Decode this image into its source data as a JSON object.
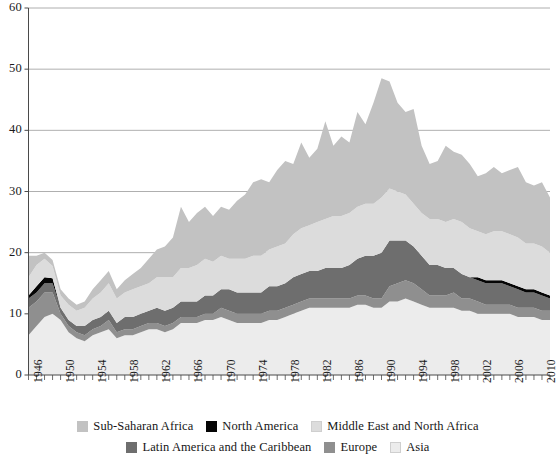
{
  "chart_data": {
    "type": "area",
    "stacked": true,
    "title": "",
    "subtitle": "",
    "xlabel": "",
    "ylabel": "",
    "xlim": [
      1946,
      2011
    ],
    "ylim": [
      0,
      60
    ],
    "yticks": [
      0,
      10,
      20,
      30,
      40,
      50,
      60
    ],
    "ytick_labels": [
      "0",
      "10",
      "20",
      "30",
      "40",
      "50",
      "60"
    ],
    "gridlines": true,
    "grid_axis": "y",
    "minor_xticks_every": 1,
    "legend_position": "bottom",
    "x": [
      1946,
      1947,
      1948,
      1949,
      1950,
      1951,
      1952,
      1953,
      1954,
      1955,
      1956,
      1957,
      1958,
      1959,
      1960,
      1961,
      1962,
      1963,
      1964,
      1965,
      1966,
      1967,
      1968,
      1969,
      1970,
      1971,
      1972,
      1973,
      1974,
      1975,
      1976,
      1977,
      1978,
      1979,
      1980,
      1981,
      1982,
      1983,
      1984,
      1985,
      1986,
      1987,
      1988,
      1989,
      1990,
      1991,
      1992,
      1993,
      1994,
      1995,
      1996,
      1997,
      1998,
      1999,
      2000,
      2001,
      2002,
      2003,
      2004,
      2005,
      2006,
      2007,
      2008,
      2009,
      2010,
      2011
    ],
    "xtick_labels": [
      "1946",
      "1950",
      "1954",
      "1958",
      "1962",
      "1966",
      "1970",
      "1974",
      "1978",
      "1982",
      "1986",
      "1990",
      "1994",
      "1998",
      "2002",
      "2006",
      "2010"
    ],
    "xtick_values": [
      1946,
      1950,
      1954,
      1958,
      1962,
      1966,
      1970,
      1974,
      1978,
      1982,
      1986,
      1990,
      1994,
      1998,
      2002,
      2006,
      2010
    ],
    "stack_order_bottom_to_top": [
      "Asia",
      "Europe",
      "Latin America and the Caribbean",
      "North America",
      "Middle East and North Africa",
      "Sub-Saharan Africa"
    ],
    "series": [
      {
        "name": "Asia",
        "color": "#ececec",
        "values": [
          6.5,
          8.0,
          9.5,
          10.0,
          9.0,
          7.0,
          6.0,
          5.5,
          6.5,
          7.0,
          7.5,
          6.0,
          6.5,
          6.5,
          7.0,
          7.5,
          7.5,
          7.0,
          7.5,
          8.5,
          8.5,
          8.5,
          9.0,
          9.0,
          9.5,
          9.0,
          8.5,
          8.5,
          8.5,
          8.5,
          9.0,
          9.0,
          9.5,
          10.0,
          10.5,
          11.0,
          11.0,
          11.0,
          11.0,
          11.0,
          11.0,
          11.5,
          11.5,
          11.0,
          11.0,
          12.0,
          12.0,
          12.5,
          12.0,
          11.5,
          11.0,
          11.0,
          11.0,
          11.0,
          10.5,
          10.5,
          10.0,
          10.0,
          10.0,
          10.0,
          10.0,
          9.5,
          9.5,
          9.5,
          9.0,
          9.0
        ]
      },
      {
        "name": "Europe",
        "color": "#8f8f8f",
        "values": [
          4.5,
          4.0,
          4.0,
          3.5,
          1.0,
          1.0,
          1.0,
          1.0,
          1.0,
          1.0,
          1.5,
          1.0,
          1.0,
          1.0,
          1.0,
          1.0,
          1.0,
          1.0,
          1.0,
          1.0,
          1.0,
          1.0,
          1.0,
          1.0,
          1.5,
          1.5,
          1.5,
          1.5,
          1.5,
          1.5,
          1.5,
          1.5,
          1.5,
          1.5,
          1.5,
          1.5,
          1.5,
          1.5,
          1.5,
          1.5,
          1.5,
          1.5,
          1.5,
          1.5,
          1.5,
          2.5,
          3.0,
          3.0,
          3.0,
          2.5,
          2.0,
          2.0,
          2.0,
          2.5,
          2.0,
          2.0,
          2.0,
          1.5,
          1.5,
          1.5,
          1.5,
          1.5,
          1.5,
          1.5,
          1.5,
          1.5
        ]
      },
      {
        "name": "Latin America and the Caribbean",
        "color": "#6e6e6e",
        "values": [
          1.5,
          1.5,
          1.5,
          1.5,
          1.0,
          1.0,
          1.0,
          1.5,
          1.5,
          1.5,
          1.5,
          1.5,
          2.0,
          2.0,
          2.0,
          2.0,
          2.5,
          2.5,
          2.5,
          2.5,
          2.5,
          2.5,
          3.0,
          3.0,
          3.0,
          3.5,
          3.5,
          3.5,
          3.5,
          3.5,
          4.0,
          4.0,
          4.0,
          4.5,
          4.5,
          4.5,
          4.5,
          5.0,
          5.0,
          5.0,
          5.5,
          6.0,
          6.5,
          7.0,
          7.5,
          7.5,
          7.0,
          6.5,
          6.0,
          5.5,
          5.0,
          5.0,
          4.5,
          4.0,
          4.0,
          3.5,
          3.5,
          3.5,
          3.5,
          3.5,
          3.0,
          3.0,
          2.5,
          2.5,
          2.5,
          2.0
        ]
      },
      {
        "name": "North America",
        "color": "#050505",
        "values": [
          0.5,
          1.0,
          1.0,
          0.8,
          0.0,
          0.0,
          0.0,
          0.0,
          0.0,
          0.0,
          0.0,
          0.0,
          0.0,
          0.0,
          0.0,
          0.0,
          0.0,
          0.0,
          0.0,
          0.0,
          0.0,
          0.0,
          0.0,
          0.0,
          0.0,
          0.0,
          0.0,
          0.0,
          0.0,
          0.0,
          0.0,
          0.0,
          0.0,
          0.0,
          0.0,
          0.0,
          0.0,
          0.0,
          0.0,
          0.0,
          0.0,
          0.0,
          0.0,
          0.0,
          0.0,
          0.0,
          0.0,
          0.0,
          0.0,
          0.0,
          0.0,
          0.0,
          0.0,
          0.0,
          0.0,
          0.0,
          0.5,
          0.5,
          0.5,
          0.5,
          0.5,
          0.5,
          0.5,
          0.5,
          0.5,
          0.5
        ]
      },
      {
        "name": "Middle East and North Africa",
        "color": "#dcdcdc",
        "values": [
          3.0,
          3.5,
          3.0,
          2.0,
          2.0,
          2.5,
          2.5,
          3.0,
          3.5,
          4.0,
          4.5,
          4.0,
          4.0,
          4.5,
          4.5,
          4.5,
          5.0,
          5.5,
          5.0,
          5.5,
          5.5,
          6.0,
          6.0,
          5.5,
          5.5,
          5.0,
          5.5,
          5.5,
          6.0,
          6.0,
          6.0,
          6.5,
          6.5,
          7.0,
          7.5,
          7.5,
          8.0,
          8.0,
          8.5,
          8.5,
          8.5,
          8.5,
          8.5,
          8.5,
          9.0,
          8.5,
          8.0,
          7.5,
          7.0,
          7.0,
          7.5,
          7.5,
          7.5,
          8.0,
          8.5,
          8.0,
          7.5,
          7.5,
          8.0,
          8.0,
          8.0,
          8.0,
          7.5,
          7.5,
          7.5,
          7.0
        ]
      },
      {
        "name": "Sub-Saharan Africa",
        "color": "#c2c2c2",
        "values": [
          3.5,
          1.5,
          1.0,
          1.0,
          1.0,
          1.0,
          1.0,
          1.0,
          1.5,
          2.0,
          2.0,
          1.5,
          2.0,
          2.5,
          3.0,
          4.0,
          4.5,
          5.0,
          6.5,
          10.0,
          7.5,
          8.5,
          8.5,
          7.5,
          8.0,
          8.0,
          9.5,
          10.5,
          12.0,
          12.5,
          11.0,
          12.5,
          13.5,
          11.5,
          14.0,
          11.0,
          12.0,
          16.0,
          11.5,
          13.0,
          11.5,
          15.5,
          13.0,
          16.5,
          19.5,
          17.5,
          14.5,
          13.5,
          15.5,
          11.0,
          9.0,
          9.5,
          12.5,
          11.0,
          11.0,
          10.5,
          9.0,
          10.0,
          10.5,
          9.5,
          10.5,
          11.5,
          10.0,
          9.5,
          10.5,
          9.0
        ]
      }
    ]
  },
  "axes": {
    "y_labels": [
      "60",
      "50",
      "40",
      "30",
      "20",
      "10",
      "0"
    ],
    "x_labels": [
      "1946",
      "1950",
      "1954",
      "1958",
      "1962",
      "1966",
      "1970",
      "1974",
      "1978",
      "1982",
      "1986",
      "1990",
      "1994",
      "1998",
      "2002",
      "2006",
      "2010"
    ]
  },
  "legend": {
    "row1": [
      {
        "label": "Sub-Saharan Africa",
        "color": "#c2c2c2"
      },
      {
        "label": "North America",
        "color": "#050505"
      },
      {
        "label": "Middle East and North Africa",
        "color": "#dcdcdc"
      }
    ],
    "row2": [
      {
        "label": "Latin America and the Caribbean",
        "color": "#6e6e6e"
      },
      {
        "label": "Europe",
        "color": "#8f8f8f"
      },
      {
        "label": "Asia",
        "color": "#ececec"
      }
    ]
  },
  "style": {
    "grid_color": "#9b9b9b",
    "axis_color": "#4a4a4a",
    "text_color": "#111111",
    "background": "#ffffff"
  }
}
